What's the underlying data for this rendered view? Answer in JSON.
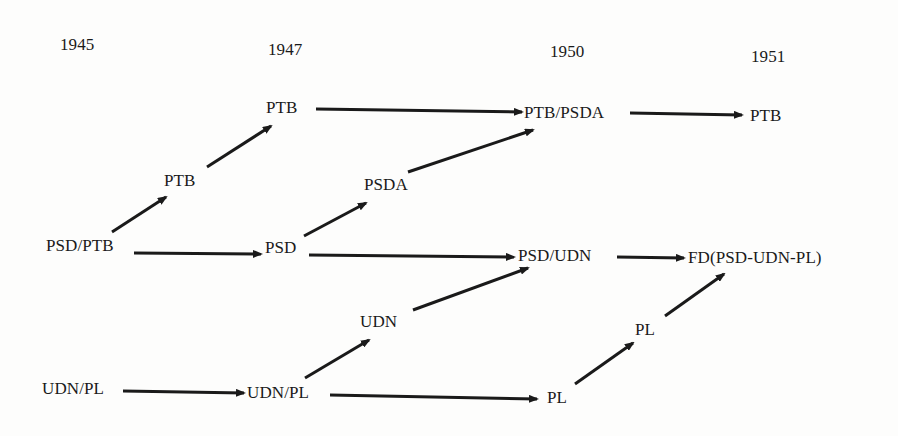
{
  "years": [
    {
      "id": "y1945",
      "label": "1945",
      "x": 60,
      "y": 45
    },
    {
      "id": "y1947",
      "label": "1947",
      "x": 268,
      "y": 50
    },
    {
      "id": "y1950",
      "label": "1950",
      "x": 550,
      "y": 52
    },
    {
      "id": "y1951",
      "label": "1951",
      "x": 751,
      "y": 57
    }
  ],
  "nodes": [
    {
      "id": "psd_ptb_1945",
      "label": "PSD/PTB",
      "x": 46,
      "y": 246
    },
    {
      "id": "udn_pl_1945",
      "label": "UDN/PL",
      "x": 42,
      "y": 389
    },
    {
      "id": "ptb_mid_a",
      "label": "PTB",
      "x": 164,
      "y": 181
    },
    {
      "id": "ptb_1947",
      "label": "PTB",
      "x": 266,
      "y": 108
    },
    {
      "id": "psd_1947",
      "label": "PSD",
      "x": 265,
      "y": 248
    },
    {
      "id": "udn_pl_1947",
      "label": "UDN/PL",
      "x": 247,
      "y": 393
    },
    {
      "id": "psda_mid",
      "label": "PSDA",
      "x": 364,
      "y": 185
    },
    {
      "id": "udn_mid",
      "label": "UDN",
      "x": 360,
      "y": 322
    },
    {
      "id": "ptb_psda_1950",
      "label": "PTB/PSDA",
      "x": 524,
      "y": 113
    },
    {
      "id": "psd_udn_1950",
      "label": "PSD/UDN",
      "x": 518,
      "y": 256
    },
    {
      "id": "pl_1950",
      "label": "PL",
      "x": 547,
      "y": 398
    },
    {
      "id": "pl_mid",
      "label": "PL",
      "x": 635,
      "y": 330
    },
    {
      "id": "ptb_1951",
      "label": "PTB",
      "x": 750,
      "y": 116
    },
    {
      "id": "fd_1951",
      "label": "FD(PSD-UDN-PL)",
      "x": 688,
      "y": 258
    }
  ],
  "edges": [
    {
      "from": "psd_ptb_1945",
      "to": "ptb_mid_a",
      "x1": 112,
      "y1": 232,
      "x2": 166,
      "y2": 197
    },
    {
      "from": "ptb_mid_a",
      "to": "ptb_1947",
      "x1": 207,
      "y1": 167,
      "x2": 271,
      "y2": 126
    },
    {
      "from": "ptb_1947",
      "to": "ptb_psda_1950",
      "x1": 316,
      "y1": 109,
      "x2": 522,
      "y2": 112
    },
    {
      "from": "ptb_psda_1950",
      "to": "ptb_1951",
      "x1": 630,
      "y1": 113,
      "x2": 742,
      "y2": 115
    },
    {
      "from": "psda_mid",
      "to": "ptb_psda_1950",
      "x1": 408,
      "y1": 172,
      "x2": 533,
      "y2": 130
    },
    {
      "from": "psd_ptb_1945",
      "to": "psd_1947",
      "x1": 134,
      "y1": 253,
      "x2": 261,
      "y2": 254
    },
    {
      "from": "psd_1947",
      "to": "psda_mid",
      "x1": 304,
      "y1": 236,
      "x2": 366,
      "y2": 203
    },
    {
      "from": "psd_1947",
      "to": "psd_udn_1950",
      "x1": 309,
      "y1": 255,
      "x2": 514,
      "y2": 257
    },
    {
      "from": "psd_udn_1950",
      "to": "fd_1951",
      "x1": 617,
      "y1": 257,
      "x2": 684,
      "y2": 258
    },
    {
      "from": "udn_mid",
      "to": "psd_udn_1950",
      "x1": 413,
      "y1": 310,
      "x2": 528,
      "y2": 268
    },
    {
      "from": "udn_pl_1945",
      "to": "udn_pl_1947",
      "x1": 123,
      "y1": 391,
      "x2": 244,
      "y2": 393
    },
    {
      "from": "udn_pl_1947",
      "to": "udn_mid",
      "x1": 305,
      "y1": 378,
      "x2": 369,
      "y2": 340
    },
    {
      "from": "udn_pl_1947",
      "to": "pl_1950",
      "x1": 330,
      "y1": 395,
      "x2": 537,
      "y2": 399
    },
    {
      "from": "pl_1950",
      "to": "pl_mid",
      "x1": 575,
      "y1": 384,
      "x2": 633,
      "y2": 343
    },
    {
      "from": "pl_mid",
      "to": "fd_1951",
      "x1": 665,
      "y1": 316,
      "x2": 724,
      "y2": 274
    }
  ],
  "colors": {
    "ink": "#1a1a1a",
    "background": "#fdfdfc"
  }
}
